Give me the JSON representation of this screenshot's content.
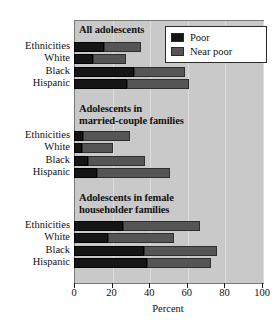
{
  "chart_data": {
    "type": "bar",
    "orientation": "horizontal",
    "stacked": true,
    "title": "",
    "xlabel": "Percent",
    "ylabel": "",
    "xlim": [
      0,
      100
    ],
    "xticks": [
      0,
      20,
      40,
      60,
      80,
      100
    ],
    "xtick_labels": [
      "0",
      "20",
      "40",
      "60",
      "80",
      "100"
    ],
    "grid": true,
    "legend_position": "top-right",
    "legend": [
      {
        "name": "Poor",
        "color": "#151515"
      },
      {
        "name": "Near poor",
        "color": "#555555"
      }
    ],
    "categories": [
      "Ethnicities",
      "White",
      "Black",
      "Hispanic"
    ],
    "panels": [
      {
        "title": "All adolescents",
        "categories": [
          "Ethnicities",
          "White",
          "Black",
          "Hispanic"
        ],
        "series": [
          {
            "name": "Poor",
            "values": [
              16,
              10,
              32,
              28
            ]
          },
          {
            "name": "Near poor",
            "values": [
              19.5,
              17.5,
              27,
              33
            ]
          }
        ],
        "totals": [
          35.5,
          27.5,
          59,
          61
        ]
      },
      {
        "title": "Adolescents in\nmarried-couple families",
        "categories": [
          "Ethnicities",
          "White",
          "Black",
          "Hispanic"
        ],
        "series": [
          {
            "name": "Poor",
            "values": [
              5,
              4,
              7.5,
              12
            ]
          },
          {
            "name": "Near poor",
            "values": [
              25,
              17,
              30.5,
              39
            ]
          }
        ],
        "totals": [
          30,
          21,
          38,
          51
        ]
      },
      {
        "title": "Adolescents in female\nhouseholder families",
        "categories": [
          "Ethnicities",
          "White",
          "Black",
          "Hispanic"
        ],
        "series": [
          {
            "name": "Poor",
            "values": [
              26,
              18,
              37,
              39
            ]
          },
          {
            "name": "Near poor",
            "values": [
              41,
              35,
              39,
              34
            ]
          }
        ],
        "totals": [
          67,
          53,
          76,
          73
        ]
      }
    ]
  },
  "axis": {
    "xlabel": "Percent",
    "ticks": [
      "0",
      "20",
      "40",
      "60",
      "80",
      "100"
    ]
  },
  "legend": {
    "poor_label": "Poor",
    "near_poor_label": "Near poor"
  },
  "panels": {
    "p0_title": "All adolescents",
    "p1_title": "Adolescents in\nmarried-couple families",
    "p2_title": "Adolescents in female\nhouseholder families"
  },
  "categories": {
    "c0": "Ethnicities",
    "c1": "White",
    "c2": "Black",
    "c3": "Hispanic"
  },
  "colors": {
    "poor": "#151515",
    "near_poor": "#555555",
    "plot_bg": "#c9c9c9"
  }
}
